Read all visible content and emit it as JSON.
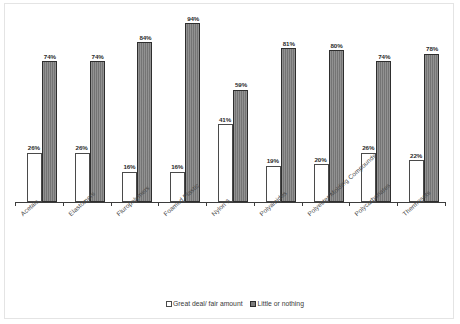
{
  "chart_data": {
    "type": "bar",
    "title": "",
    "xlabel": "",
    "ylabel": "",
    "ylim": [
      0,
      100
    ],
    "grid": false,
    "legend_position": "bottom",
    "categories": [
      "Acetals",
      "Elastomers",
      "Fluropolymers",
      "Foamed Plastic",
      "Nylon 6",
      "Polyamides",
      "Polyester Molding Compounds",
      "Polycarbonates",
      "Thermosets"
    ],
    "series": [
      {
        "name": "Great deal/ fair amount",
        "color": "#ffffff",
        "values": [
          26,
          26,
          16,
          16,
          41,
          19,
          20,
          26,
          22
        ],
        "labels": [
          "26%",
          "26%",
          "16%",
          "16%",
          "41%",
          "19%",
          "20%",
          "26%",
          "22%"
        ]
      },
      {
        "name": "Little or nothing",
        "color": "#7d7d7d",
        "values": [
          74,
          74,
          84,
          94,
          59,
          81,
          80,
          74,
          78
        ],
        "labels": [
          "74%",
          "74%",
          "84%",
          "94%",
          "59%",
          "81%",
          "80%",
          "74%",
          "78%"
        ]
      }
    ]
  },
  "legend": {
    "items": [
      {
        "label": "Great deal/ fair amount",
        "swatch": "white-square-icon"
      },
      {
        "label": "Little or nothing",
        "swatch": "gray-square-icon"
      }
    ]
  }
}
